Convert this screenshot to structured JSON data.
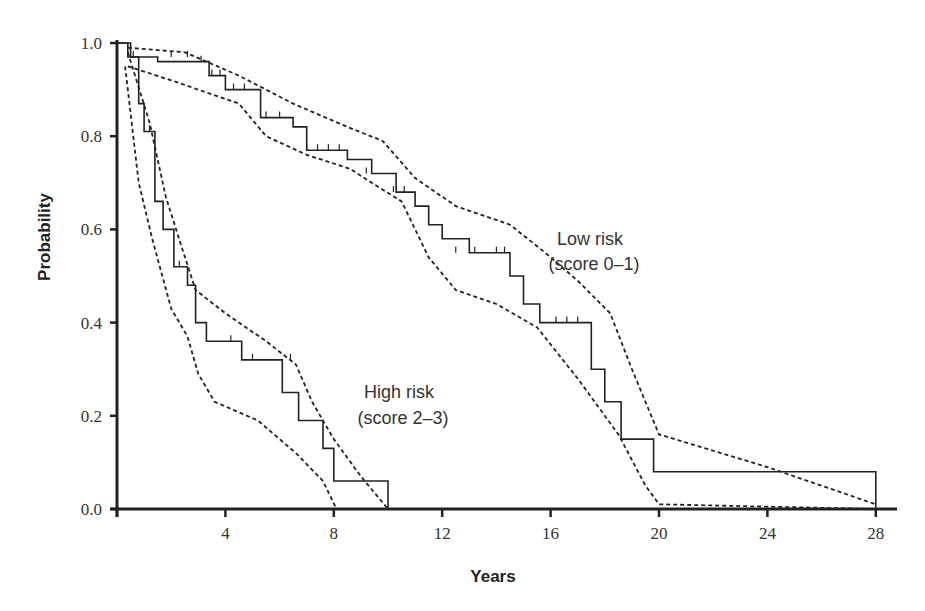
{
  "chart_data": {
    "type": "line",
    "title": "",
    "xlabel": "Years",
    "ylabel": "Probability",
    "xlim": [
      0,
      29
    ],
    "ylim": [
      0.0,
      1.0
    ],
    "x_ticks": [
      4,
      8,
      12,
      16,
      20,
      24,
      28
    ],
    "x_tick_labels": [
      "4",
      "8",
      "12",
      "16",
      "20",
      "24",
      "28"
    ],
    "y_ticks": [
      0.0,
      0.2,
      0.4,
      0.6,
      0.8,
      1.0
    ],
    "y_tick_labels": [
      "0.0",
      "0.2",
      "0.4",
      "0.6",
      "0.8",
      "1.0"
    ],
    "grid": false,
    "legend": "none (inline annotations)",
    "annotations": [
      {
        "line1": "Low risk",
        "line2": "(score 0–1)"
      },
      {
        "line1": "High risk",
        "line2": "(score 2–3)"
      }
    ],
    "series": [
      {
        "name": "Low risk (score 0-1)",
        "style": "step-solid",
        "x": [
          0,
          0.4,
          0.4,
          1.5,
          1.5,
          3.4,
          3.4,
          4.0,
          4.0,
          5.3,
          5.3,
          6.5,
          6.5,
          7.0,
          7.0,
          8.5,
          8.5,
          9.4,
          9.4,
          10.3,
          10.3,
          11.0,
          11.0,
          11.5,
          11.5,
          12.0,
          12.0,
          13.0,
          13.0,
          14.5,
          14.5,
          15.0,
          15.0,
          15.6,
          15.6,
          17.5,
          17.5,
          18.0,
          18.0,
          18.6,
          18.6,
          19.8,
          19.8,
          28.0,
          28.0
        ],
        "y": [
          1.0,
          1.0,
          0.97,
          0.97,
          0.96,
          0.96,
          0.93,
          0.93,
          0.9,
          0.9,
          0.84,
          0.84,
          0.82,
          0.82,
          0.77,
          0.77,
          0.75,
          0.75,
          0.72,
          0.72,
          0.68,
          0.68,
          0.65,
          0.65,
          0.61,
          0.61,
          0.58,
          0.58,
          0.55,
          0.55,
          0.5,
          0.5,
          0.44,
          0.44,
          0.4,
          0.4,
          0.3,
          0.3,
          0.23,
          0.23,
          0.15,
          0.15,
          0.08,
          0.08,
          0.0
        ]
      },
      {
        "name": "Low risk upper 95% CI",
        "style": "dashed",
        "x": [
          0.4,
          2.5,
          4.5,
          6.5,
          8.5,
          9.8,
          11.0,
          12.5,
          14.5,
          15.8,
          17.0,
          18.2,
          19.0,
          20.0,
          24.0,
          28.0
        ],
        "y": [
          0.99,
          0.98,
          0.93,
          0.87,
          0.82,
          0.79,
          0.71,
          0.65,
          0.61,
          0.55,
          0.49,
          0.42,
          0.3,
          0.16,
          0.09,
          0.01
        ]
      },
      {
        "name": "Low risk lower 95% CI",
        "style": "dashed",
        "x": [
          0.4,
          2.0,
          4.5,
          5.5,
          7.0,
          8.6,
          9.4,
          10.5,
          11.5,
          12.5,
          14.0,
          15.5,
          17.0,
          18.5,
          19.5,
          20.0,
          28.0
        ],
        "y": [
          0.95,
          0.92,
          0.87,
          0.8,
          0.76,
          0.73,
          0.7,
          0.66,
          0.54,
          0.47,
          0.44,
          0.39,
          0.28,
          0.16,
          0.05,
          0.01,
          0.0
        ]
      },
      {
        "name": "High risk (score 2-3)",
        "style": "step-solid",
        "x": [
          0,
          0.5,
          0.5,
          0.8,
          0.8,
          1.0,
          1.0,
          1.4,
          1.4,
          1.7,
          1.7,
          2.1,
          2.1,
          2.6,
          2.6,
          2.9,
          2.9,
          3.3,
          3.3,
          4.6,
          4.6,
          6.1,
          6.1,
          6.7,
          6.7,
          7.6,
          7.6,
          8.0,
          8.0,
          10.0,
          10.0
        ],
        "y": [
          1.0,
          1.0,
          0.97,
          0.97,
          0.87,
          0.87,
          0.81,
          0.81,
          0.66,
          0.66,
          0.6,
          0.6,
          0.52,
          0.52,
          0.48,
          0.48,
          0.4,
          0.4,
          0.36,
          0.36,
          0.32,
          0.32,
          0.25,
          0.25,
          0.19,
          0.19,
          0.13,
          0.13,
          0.06,
          0.06,
          0.0
        ]
      },
      {
        "name": "High risk upper 95% CI",
        "style": "dashed",
        "x": [
          0.4,
          1.2,
          1.8,
          2.4,
          2.9,
          4.0,
          5.5,
          6.6,
          7.2,
          8.0,
          9.0,
          10.0
        ],
        "y": [
          0.98,
          0.83,
          0.67,
          0.56,
          0.47,
          0.42,
          0.36,
          0.31,
          0.23,
          0.15,
          0.07,
          0.0
        ]
      },
      {
        "name": "High risk lower 95% CI",
        "style": "dashed",
        "x": [
          0.3,
          0.8,
          1.3,
          2.0,
          2.6,
          3.0,
          3.6,
          5.2,
          6.6,
          7.6,
          8.1,
          10.0
        ],
        "y": [
          0.95,
          0.7,
          0.58,
          0.43,
          0.37,
          0.29,
          0.23,
          0.19,
          0.12,
          0.06,
          0.0,
          0.0
        ]
      }
    ]
  },
  "plot_area": {
    "x0_px": 117,
    "x_per_year_px": 27.1,
    "y0_px": 509,
    "y1_px": 43
  }
}
